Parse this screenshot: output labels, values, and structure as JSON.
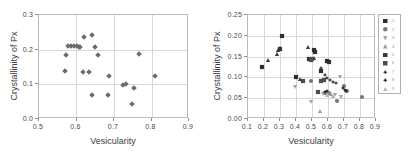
{
  "chart_data": [
    {
      "type": "scatter",
      "panel": "left",
      "title": "",
      "xlabel": "Vesicularity",
      "ylabel": "Crystallinity of Px",
      "xlim": [
        0.5,
        0.9
      ],
      "ylim": [
        0.0,
        0.3
      ],
      "xticks": [
        "0.5",
        "0.6",
        "0.7",
        "0.8",
        "0.9"
      ],
      "xtick_values": [
        0.5,
        0.6,
        0.7,
        0.8,
        0.9
      ],
      "yticks": [
        "0.0",
        "0.1",
        "0.2",
        "0.3"
      ],
      "ytick_values": [
        0.0,
        0.1,
        0.2,
        0.3
      ],
      "grid": true,
      "legend": false,
      "marker": "diamond",
      "marker_color": "#6b6b6b",
      "points": [
        {
          "x": 0.572,
          "y": 0.137
        },
        {
          "x": 0.575,
          "y": 0.182
        },
        {
          "x": 0.58,
          "y": 0.207
        },
        {
          "x": 0.589,
          "y": 0.208
        },
        {
          "x": 0.596,
          "y": 0.207
        },
        {
          "x": 0.603,
          "y": 0.207
        },
        {
          "x": 0.608,
          "y": 0.206
        },
        {
          "x": 0.612,
          "y": 0.205
        },
        {
          "x": 0.62,
          "y": 0.132
        },
        {
          "x": 0.622,
          "y": 0.234
        },
        {
          "x": 0.636,
          "y": 0.133
        },
        {
          "x": 0.643,
          "y": 0.24
        },
        {
          "x": 0.645,
          "y": 0.067
        },
        {
          "x": 0.652,
          "y": 0.205
        },
        {
          "x": 0.66,
          "y": 0.182
        },
        {
          "x": 0.686,
          "y": 0.065
        },
        {
          "x": 0.688,
          "y": 0.122
        },
        {
          "x": 0.727,
          "y": 0.096
        },
        {
          "x": 0.735,
          "y": 0.097
        },
        {
          "x": 0.75,
          "y": 0.041
        },
        {
          "x": 0.757,
          "y": 0.087
        },
        {
          "x": 0.768,
          "y": 0.186
        },
        {
          "x": 0.812,
          "y": 0.12
        }
      ]
    },
    {
      "type": "scatter",
      "panel": "right",
      "title": "",
      "xlabel": "Vesicularity",
      "ylabel": "Crystallinity of Px",
      "xlim": [
        0.1,
        0.9
      ],
      "ylim": [
        0.0,
        0.25
      ],
      "xticks": [
        "0.1",
        "0.2",
        "0.3",
        "0.4",
        "0.5",
        "0.6",
        "0.7",
        "0.8",
        "0.9"
      ],
      "xtick_values": [
        0.1,
        0.2,
        0.3,
        0.4,
        0.5,
        0.6,
        0.7,
        0.8,
        0.9
      ],
      "yticks": [
        "0.00",
        "0.05",
        "0.10",
        "0.15",
        "0.20",
        "0.25"
      ],
      "ytick_values": [
        0.0,
        0.05,
        0.1,
        0.15,
        0.2,
        0.25
      ],
      "grid": true,
      "legend": true,
      "legend_position": "right-outside",
      "series": [
        {
          "name": "1",
          "marker": "square",
          "color": "#2e2e2e",
          "points": [
            {
              "x": 0.192,
              "y": 0.122
            },
            {
              "x": 0.305,
              "y": 0.165
            },
            {
              "x": 0.318,
              "y": 0.197
            },
            {
              "x": 0.405,
              "y": 0.099
            },
            {
              "x": 0.487,
              "y": 0.141
            },
            {
              "x": 0.52,
              "y": 0.163
            },
            {
              "x": 0.528,
              "y": 0.158
            },
            {
              "x": 0.56,
              "y": 0.112
            },
            {
              "x": 0.6,
              "y": 0.137
            },
            {
              "x": 0.612,
              "y": 0.134
            }
          ]
        },
        {
          "name": "2",
          "marker": "circle",
          "color": "#787878",
          "points": [
            {
              "x": 0.5,
              "y": 0.089
            },
            {
              "x": 0.588,
              "y": 0.06
            },
            {
              "x": 0.612,
              "y": 0.059
            },
            {
              "x": 0.66,
              "y": 0.04
            },
            {
              "x": 0.705,
              "y": 0.078
            },
            {
              "x": 0.728,
              "y": 0.065
            },
            {
              "x": 0.818,
              "y": 0.051
            }
          ]
        },
        {
          "name": "3",
          "marker": "triangle-down",
          "color": "#a5a5a5",
          "points": [
            {
              "x": 0.4,
              "y": 0.075
            },
            {
              "x": 0.498,
              "y": 0.039
            },
            {
              "x": 0.575,
              "y": 0.058
            },
            {
              "x": 0.648,
              "y": 0.056
            },
            {
              "x": 0.68,
              "y": 0.098
            },
            {
              "x": 0.688,
              "y": 0.05
            }
          ]
        },
        {
          "name": "4",
          "marker": "triangle-up",
          "color": "#9b9b9b",
          "points": [
            {
              "x": 0.555,
              "y": 0.018
            },
            {
              "x": 0.6,
              "y": 0.062
            },
            {
              "x": 0.628,
              "y": 0.058
            }
          ]
        },
        {
          "name": "5",
          "marker": "triangle-up",
          "color": "#3a3a3a",
          "points": [
            {
              "x": 0.232,
              "y": 0.14
            },
            {
              "x": 0.288,
              "y": 0.155
            },
            {
              "x": 0.296,
              "y": 0.163
            },
            {
              "x": 0.308,
              "y": 0.168
            },
            {
              "x": 0.43,
              "y": 0.094
            },
            {
              "x": 0.48,
              "y": 0.171
            },
            {
              "x": 0.52,
              "y": 0.144
            }
          ]
        },
        {
          "name": "6",
          "marker": "square",
          "color": "#4d4d4d",
          "points": [
            {
              "x": 0.452,
              "y": 0.089
            },
            {
              "x": 0.5,
              "y": 0.139
            },
            {
              "x": 0.508,
              "y": 0.143
            },
            {
              "x": 0.545,
              "y": 0.063
            },
            {
              "x": 0.56,
              "y": 0.09
            },
            {
              "x": 0.583,
              "y": 0.092
            }
          ]
        },
        {
          "name": "7",
          "marker": "plus-diamond",
          "color": "#303030",
          "points": [
            {
              "x": 0.565,
              "y": 0.12
            },
            {
              "x": 0.585,
              "y": 0.104
            },
            {
              "x": 0.6,
              "y": 0.095
            },
            {
              "x": 0.618,
              "y": 0.092
            },
            {
              "x": 0.64,
              "y": 0.086
            },
            {
              "x": 0.655,
              "y": 0.084
            }
          ]
        },
        {
          "name": "8",
          "marker": "plus-diamond",
          "color": "#1f1f1f",
          "points": [
            {
              "x": 0.59,
              "y": 0.063
            },
            {
              "x": 0.6,
              "y": 0.066
            },
            {
              "x": 0.7,
              "y": 0.073
            },
            {
              "x": 0.712,
              "y": 0.068
            },
            {
              "x": 0.72,
              "y": 0.064
            }
          ]
        },
        {
          "name": "9",
          "marker": "triangle-up",
          "color": "#b4b4b4",
          "points": [
            {
              "x": 0.602,
              "y": 0.055
            },
            {
              "x": 0.635,
              "y": 0.052
            }
          ]
        }
      ],
      "legend_entries": [
        {
          "label": "1",
          "marker": "square",
          "color": "#2e2e2e"
        },
        {
          "label": "2",
          "marker": "circle",
          "color": "#787878"
        },
        {
          "label": "3",
          "marker": "triangle-down",
          "color": "#a5a5a5"
        },
        {
          "label": "4",
          "marker": "triangle-up",
          "color": "#9b9b9b"
        },
        {
          "label": "5",
          "marker": "square",
          "color": "#3a3a3a"
        },
        {
          "label": "6",
          "marker": "square",
          "color": "#4d4d4d"
        },
        {
          "label": "7",
          "marker": "plus-diamond",
          "color": "#303030"
        },
        {
          "label": "8",
          "marker": "plus-diamond",
          "color": "#1f1f1f"
        },
        {
          "label": "9",
          "marker": "triangle-up",
          "color": "#b4b4b4"
        }
      ]
    }
  ]
}
